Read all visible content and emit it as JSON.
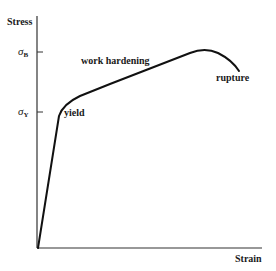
{
  "diagram": {
    "y_axis_label": "Stress",
    "x_axis_label": "Strain",
    "y_ticks": [
      {
        "symbol": "σ",
        "sub": "B",
        "y": 52
      },
      {
        "symbol": "σ",
        "sub": "Y",
        "y": 112
      }
    ],
    "annotations": {
      "yield": "yield",
      "work_hardening": "work hardening",
      "rupture": "rupture"
    },
    "colors": {
      "line": "#111111",
      "axis": "#333333"
    }
  }
}
